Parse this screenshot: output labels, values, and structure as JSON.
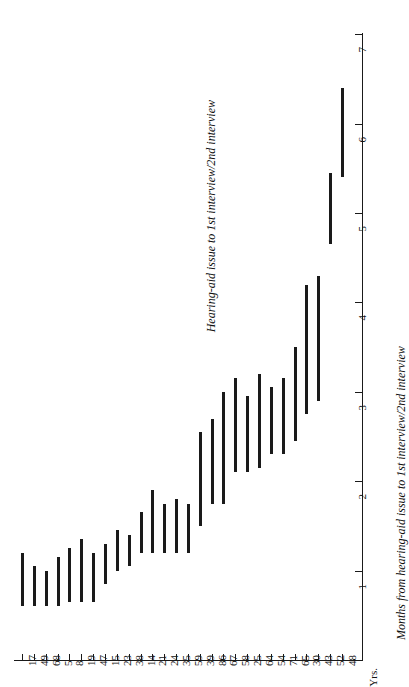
{
  "chart_data": {
    "type": "bar",
    "orientation": "rotated-90-ccw",
    "title": "Hearing-aid issue to 1st interview/2nd interview",
    "xlabel": "Yrs.",
    "ylabel": "Months from hearing-aid issue to 1st interview/2nd interview",
    "grid": false,
    "legend": null,
    "value_axis_label": "Months from hearing-aid issue to 1st interview/2nd interview",
    "value_axis_unit_label": "Yrs.",
    "value_ticks": [
      1,
      2,
      3,
      4,
      5,
      6,
      7
    ],
    "value_tick_labels": [
      "1",
      "2",
      "3",
      "4",
      "5",
      "6",
      "7"
    ],
    "ylim": [
      0,
      7
    ],
    "categories": [
      "17",
      "49",
      "68",
      "5",
      "8",
      "19",
      "47",
      "15",
      "23",
      "38",
      "14",
      "21",
      "24",
      "35",
      "59",
      "39",
      "86",
      "67",
      "58",
      "25",
      "64",
      "54",
      "71",
      "65",
      "30",
      "43",
      "52",
      "48"
    ],
    "category_axis_label": "Yrs.",
    "series": [
      {
        "name": "Hearing-aid issue to 1st interview/2nd interview",
        "type": "range",
        "ranges": [
          {
            "category": "17",
            "start": 0.6,
            "end": 1.2
          },
          {
            "category": "49",
            "start": 0.6,
            "end": 1.05
          },
          {
            "category": "68",
            "start": 0.6,
            "end": 1.0
          },
          {
            "category": "5",
            "start": 0.6,
            "end": 1.15
          },
          {
            "category": "8",
            "start": 0.65,
            "end": 1.25
          },
          {
            "category": "19",
            "start": 0.65,
            "end": 1.35
          },
          {
            "category": "47",
            "start": 0.65,
            "end": 1.2
          },
          {
            "category": "15",
            "start": 0.85,
            "end": 1.3
          },
          {
            "category": "23",
            "start": 1.0,
            "end": 1.45
          },
          {
            "category": "38",
            "start": 1.05,
            "end": 1.4
          },
          {
            "category": "14",
            "start": 1.2,
            "end": 1.65
          },
          {
            "category": "21",
            "start": 1.2,
            "end": 1.9
          },
          {
            "category": "24",
            "start": 1.2,
            "end": 1.75
          },
          {
            "category": "35",
            "start": 1.2,
            "end": 1.8
          },
          {
            "category": "59",
            "start": 1.2,
            "end": 1.75
          },
          {
            "category": "39",
            "start": 1.5,
            "end": 2.55
          },
          {
            "category": "86",
            "start": 1.75,
            "end": 2.7
          },
          {
            "category": "67",
            "start": 1.75,
            "end": 3.0
          },
          {
            "category": "58",
            "start": 2.1,
            "end": 3.15
          },
          {
            "category": "25",
            "start": 2.1,
            "end": 2.95
          },
          {
            "category": "64",
            "start": 2.15,
            "end": 3.2
          },
          {
            "category": "54",
            "start": 2.3,
            "end": 3.05
          },
          {
            "category": "71",
            "start": 2.3,
            "end": 3.15
          },
          {
            "category": "65",
            "start": 2.45,
            "end": 3.5
          },
          {
            "category": "30",
            "start": 2.75,
            "end": 4.2
          },
          {
            "category": "43",
            "start": 2.9,
            "end": 4.3
          },
          {
            "category": "52",
            "start": 4.65,
            "end": 5.45
          },
          {
            "category": "48",
            "start": 5.4,
            "end": 6.4
          }
        ]
      }
    ]
  },
  "colors": {
    "bar": "#1a1a1a",
    "axis": "#1a1a1a",
    "background": "#ffffff",
    "text": "#111111"
  }
}
